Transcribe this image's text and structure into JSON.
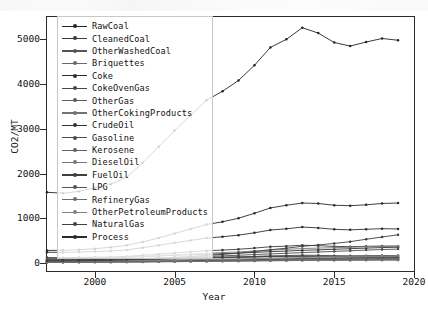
{
  "figure": {
    "axis_color": "#2b2b2b",
    "background": "#ffffff"
  },
  "axes": {
    "ylabel": "CO2/MT",
    "xlabel": "Year",
    "yticks": [
      0,
      1000,
      2000,
      3000,
      4000,
      5000
    ],
    "xticks": [
      2000,
      2005,
      2010,
      2015,
      2020
    ]
  },
  "legend": {
    "position": "upper-left-inside",
    "entries": [
      "RawCoal",
      "CleanedCoal",
      "OtherWashedCoal",
      "Briquettes",
      "Coke",
      "CokeOvenGas",
      "OtherGas",
      "OtherCokingProducts",
      "CrudeOil",
      "Gasoline",
      "Kerosene",
      "DieselOil",
      "FuelOil",
      "LPG",
      "RefineryGas",
      "OtherPetroleumProducts",
      "NaturalGas",
      "Process"
    ]
  },
  "chart_data": {
    "type": "line",
    "title": "",
    "xlabel": "Year",
    "ylabel": "CO2/MT",
    "xlim": [
      1997,
      2020
    ],
    "ylim": [
      -180,
      5500
    ],
    "grid": false,
    "legend_position": "upper left",
    "marker": "dot",
    "x": [
      1997,
      1998,
      1999,
      2000,
      2001,
      2002,
      2003,
      2004,
      2005,
      2006,
      2007,
      2008,
      2009,
      2010,
      2011,
      2012,
      2013,
      2014,
      2015,
      2016,
      2017,
      2018,
      2019
    ],
    "series": [
      {
        "name": "RawCoal",
        "color": "#262626",
        "values": [
          1580,
          1560,
          1600,
          1680,
          1760,
          1920,
          2240,
          2600,
          2960,
          3300,
          3640,
          3840,
          4080,
          4420,
          4820,
          5000,
          5260,
          5140,
          4930,
          4850,
          4940,
          5020,
          4980
        ]
      },
      {
        "name": "CleanedCoal",
        "color": "#3b3b3b",
        "values": [
          120,
          118,
          122,
          128,
          134,
          146,
          170,
          196,
          222,
          248,
          274,
          288,
          306,
          332,
          362,
          376,
          396,
          386,
          370,
          364,
          372,
          378,
          375
        ]
      },
      {
        "name": "OtherWashedCoal",
        "color": "#555555",
        "values": [
          48,
          47,
          49,
          51,
          54,
          58,
          68,
          79,
          89,
          99,
          110,
          115,
          122,
          133,
          145,
          150,
          158,
          154,
          148,
          146,
          149,
          151,
          150
        ]
      },
      {
        "name": "Briquettes",
        "color": "#6a6a6a",
        "values": [
          30,
          30,
          31,
          32,
          34,
          37,
          43,
          50,
          57,
          63,
          70,
          73,
          78,
          84,
          92,
          96,
          101,
          98,
          94,
          93,
          95,
          96,
          95
        ]
      },
      {
        "name": "Coke",
        "color": "#2f2f2f",
        "values": [
          240,
          236,
          244,
          256,
          268,
          292,
          342,
          396,
          452,
          504,
          556,
          586,
          622,
          674,
          736,
          764,
          802,
          784,
          752,
          740,
          754,
          766,
          760
        ]
      },
      {
        "name": "CokeOvenGas",
        "color": "#474747",
        "values": [
          52,
          51,
          53,
          55,
          58,
          63,
          74,
          86,
          98,
          109,
          120,
          126,
          134,
          146,
          159,
          165,
          174,
          170,
          163,
          160,
          163,
          166,
          165
        ]
      },
      {
        "name": "OtherGas",
        "color": "#5e5e5e",
        "values": [
          26,
          26,
          27,
          28,
          29,
          32,
          37,
          43,
          49,
          55,
          60,
          63,
          67,
          73,
          80,
          83,
          87,
          85,
          81,
          80,
          82,
          83,
          82
        ]
      },
      {
        "name": "OtherCokingProducts",
        "color": "#737373",
        "values": [
          18,
          18,
          19,
          20,
          21,
          23,
          27,
          31,
          35,
          39,
          43,
          45,
          48,
          52,
          57,
          59,
          62,
          61,
          58,
          57,
          58,
          59,
          59
        ]
      },
      {
        "name": "CrudeOil",
        "color": "#343434",
        "values": [
          96,
          98,
          104,
          112,
          118,
          126,
          140,
          156,
          170,
          184,
          198,
          206,
          218,
          236,
          252,
          266,
          282,
          292,
          306,
          318,
          332,
          344,
          352
        ]
      },
      {
        "name": "Gasoline",
        "color": "#4d4d4d",
        "values": [
          64,
          66,
          70,
          76,
          82,
          90,
          100,
          112,
          124,
          136,
          148,
          158,
          172,
          188,
          202,
          216,
          232,
          244,
          258,
          272,
          288,
          300,
          310
        ]
      },
      {
        "name": "Kerosene",
        "color": "#636363",
        "values": [
          16,
          17,
          18,
          19,
          21,
          23,
          26,
          29,
          32,
          36,
          40,
          43,
          47,
          52,
          57,
          62,
          68,
          73,
          79,
          85,
          92,
          98,
          104
        ]
      },
      {
        "name": "DieselOil",
        "color": "#787878",
        "values": [
          88,
          92,
          98,
          106,
          116,
          128,
          144,
          162,
          180,
          198,
          216,
          230,
          248,
          268,
          288,
          304,
          322,
          332,
          342,
          350,
          360,
          368,
          374
        ]
      },
      {
        "name": "FuelOil",
        "color": "#3f3f3f",
        "values": [
          72,
          72,
          74,
          78,
          82,
          88,
          96,
          106,
          114,
          122,
          128,
          130,
          132,
          136,
          140,
          140,
          142,
          138,
          132,
          128,
          126,
          124,
          122
        ]
      },
      {
        "name": "LPG",
        "color": "#565656",
        "values": [
          22,
          23,
          25,
          27,
          30,
          33,
          37,
          42,
          47,
          52,
          57,
          61,
          66,
          72,
          78,
          84,
          91,
          97,
          104,
          111,
          119,
          126,
          133
        ]
      },
      {
        "name": "RefineryGas",
        "color": "#6d6d6d",
        "values": [
          14,
          15,
          16,
          17,
          18,
          20,
          22,
          25,
          28,
          31,
          34,
          36,
          39,
          43,
          47,
          51,
          55,
          59,
          63,
          68,
          73,
          77,
          81
        ]
      },
      {
        "name": "OtherPetroleumProducts",
        "color": "#828282",
        "values": [
          34,
          35,
          37,
          40,
          43,
          47,
          53,
          59,
          66,
          72,
          79,
          84,
          90,
          98,
          106,
          113,
          121,
          127,
          134,
          141,
          149,
          155,
          161
        ]
      },
      {
        "name": "NaturalGas",
        "color": "#404040",
        "values": [
          42,
          44,
          48,
          54,
          62,
          72,
          86,
          102,
          122,
          144,
          170,
          192,
          218,
          254,
          296,
          330,
          372,
          402,
          436,
          476,
          530,
          580,
          630
        ]
      },
      {
        "name": "Process",
        "color": "#2a2a2a",
        "values": [
          280,
          282,
          296,
          320,
          350,
          396,
          470,
          560,
          660,
          760,
          860,
          920,
          1000,
          1110,
          1230,
          1290,
          1340,
          1330,
          1290,
          1280,
          1300,
          1330,
          1340
        ]
      }
    ]
  }
}
